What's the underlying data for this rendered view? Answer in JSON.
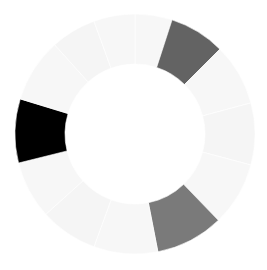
{
  "chart_data": {
    "type": "pie",
    "variant": "donut",
    "title": "",
    "legend": [],
    "center": [
      135,
      134
    ],
    "outer_radius": 120,
    "inner_radius": 70,
    "segments": [
      {
        "start": 0,
        "end": 18,
        "color": "#f7f7f7"
      },
      {
        "start": 18,
        "end": 45,
        "color": "#636363"
      },
      {
        "start": 45,
        "end": 75,
        "color": "#f7f7f7"
      },
      {
        "start": 75,
        "end": 105,
        "color": "#f5f5f5"
      },
      {
        "start": 105,
        "end": 136,
        "color": "#f7f7f7"
      },
      {
        "start": 136,
        "end": 169,
        "color": "#7a7a7a"
      },
      {
        "start": 169,
        "end": 200,
        "color": "#f7f7f7"
      },
      {
        "start": 200,
        "end": 228,
        "color": "#f5f5f5"
      },
      {
        "start": 228,
        "end": 256,
        "color": "#f7f7f7"
      },
      {
        "start": 256,
        "end": 287,
        "color": "#000000"
      },
      {
        "start": 287,
        "end": 318,
        "color": "#f7f7f7"
      },
      {
        "start": 318,
        "end": 340,
        "color": "#f5f5f5"
      },
      {
        "start": 340,
        "end": 360,
        "color": "#f7f7f7"
      }
    ]
  }
}
